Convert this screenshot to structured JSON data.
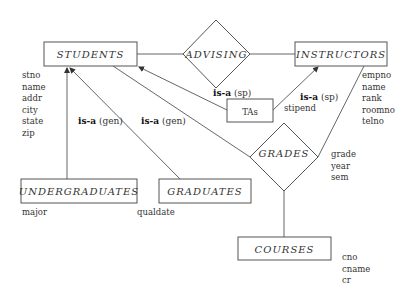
{
  "entities": {
    "students": {
      "label": "STUDENTS",
      "attributes": [
        "stno",
        "name",
        "addr",
        "city",
        "state",
        "zip"
      ]
    },
    "instructors": {
      "label": "INSTRUCTORS",
      "attributes": [
        "empno",
        "name",
        "rank",
        "roomno",
        "telno"
      ]
    },
    "tas": {
      "label": "TAs",
      "attributes": [
        "stipend"
      ]
    },
    "undergraduates": {
      "label": "UNDERGRADUATES",
      "attributes": [
        "major"
      ]
    },
    "graduates": {
      "label": "GRADUATES",
      "attributes": [
        "qualdate"
      ]
    },
    "courses": {
      "label": "COURSES",
      "attributes": [
        "cno",
        "cname",
        "cr"
      ]
    }
  },
  "relationships": {
    "advising": {
      "label": "ADVISING"
    },
    "grades": {
      "label": "GRADES",
      "attributes": [
        "grade",
        "year",
        "sem"
      ]
    }
  },
  "isa_labels": {
    "undergrad": {
      "bold": "is-a",
      "rest": " (gen)"
    },
    "graduate": {
      "bold": "is-a",
      "rest": " (gen)"
    },
    "ta_students": {
      "bold": "is-a",
      "rest": " (sp)"
    },
    "ta_instructors": {
      "bold": "is-a",
      "rest": " (sp)"
    }
  }
}
